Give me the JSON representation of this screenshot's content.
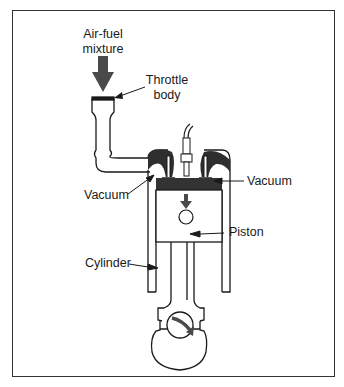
{
  "diagram": {
    "labels": {
      "air_fuel_line1": "Air-fuel",
      "air_fuel_line2": "mixture",
      "throttle_line1": "Throttle",
      "throttle_line2": "body",
      "vacuum_left": "Vacuum",
      "vacuum_right": "Vacuum",
      "piston": "Piston",
      "cylinder": "Cylinder"
    },
    "colors": {
      "stroke": "#1a1a1a",
      "dark_fill": "#3a3a3a",
      "arrow_fill": "#4a4a4a",
      "background": "#ffffff"
    }
  }
}
